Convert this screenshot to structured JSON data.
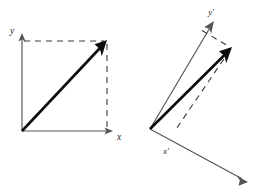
{
  "figure": {
    "background_color": "#ffffff",
    "width": 264,
    "height": 196,
    "colors": {
      "axis": "#555555",
      "vector": "#0c0c0c",
      "dashed": "#3a3a3a",
      "label": "#202020"
    }
  },
  "panels": [
    {
      "id": "left-panel",
      "name": "original-frame",
      "caption": "Vector resolved along the unrotated axes",
      "origin": {
        "x": 22,
        "y": 131
      },
      "axes": [
        {
          "name": "x-axis",
          "label": "x",
          "label_pos": {
            "x": 118,
            "y": 138
          },
          "from": {
            "x": 22,
            "y": 131
          },
          "to": {
            "x": 112,
            "y": 131
          }
        },
        {
          "name": "y-axis",
          "label": "y",
          "label_pos": {
            "x": 12,
            "y": 32
          },
          "from": {
            "x": 22,
            "y": 131
          },
          "to": {
            "x": 22,
            "y": 36
          }
        }
      ],
      "vector": {
        "name": "resultant-vector",
        "from": {
          "x": 22,
          "y": 131
        },
        "to": {
          "x": 106,
          "y": 42
        }
      },
      "projections": [
        {
          "name": "y-projection-dashed",
          "from": {
            "x": 23,
            "y": 41
          },
          "to": {
            "x": 106,
            "y": 41
          }
        },
        {
          "name": "x-projection-dashed",
          "from": {
            "x": 107,
            "y": 42
          },
          "to": {
            "x": 107,
            "y": 130
          }
        }
      ]
    },
    {
      "id": "right-panel",
      "name": "rotated-frame",
      "caption": "Same vector resolved along the rotated axes",
      "origin": {
        "x": 150,
        "y": 129
      },
      "axes": [
        {
          "name": "x-prime-axis",
          "label": "x'",
          "label_pos": {
            "x": 166,
            "y": 152
          },
          "from": {
            "x": 150,
            "y": 129
          },
          "to": {
            "x": 246,
            "y": 181
          }
        },
        {
          "name": "y-prime-axis",
          "label": "y'",
          "label_pos": {
            "x": 211,
            "y": 13
          },
          "from": {
            "x": 150,
            "y": 129
          },
          "to": {
            "x": 213,
            "y": 22
          }
        }
      ],
      "vector": {
        "name": "resultant-vector",
        "from": {
          "x": 150,
          "y": 129
        },
        "to": {
          "x": 231,
          "y": 48
        }
      },
      "projections": [
        {
          "name": "y-prime-projection-dashed",
          "from": {
            "x": 203,
            "y": 31
          },
          "to": {
            "x": 230,
            "y": 47
          }
        },
        {
          "name": "x-prime-projection-dashed",
          "from": {
            "x": 231,
            "y": 49
          },
          "to": {
            "x": 176,
            "y": 129
          }
        }
      ]
    }
  ]
}
